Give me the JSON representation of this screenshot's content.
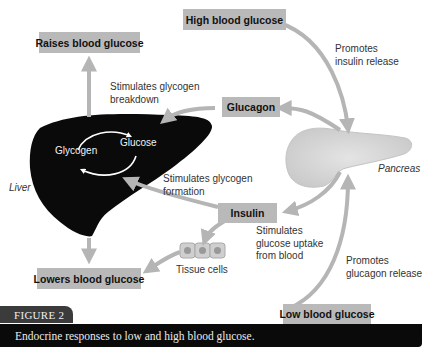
{
  "boxes": {
    "high_blood_glucose": "High blood glucose",
    "raises_blood_glucose": "Raises blood glucose",
    "glucagon": "Glucagon",
    "insulin": "Insulin",
    "lowers_blood_glucose": "Lowers blood glucose",
    "low_blood_glucose": "Low blood glucose"
  },
  "labels": {
    "promotes_insulin_release": [
      "Promotes",
      "insulin release"
    ],
    "stimulates_glycogen_breakdown": [
      "Stimulates glycogen",
      "breakdown"
    ],
    "stimulates_glycogen_formation": [
      "Stimulates glycogen",
      "formation"
    ],
    "stimulates_glucose_uptake": [
      "Stimulates",
      "glucose uptake",
      "from blood"
    ],
    "promotes_glucagon_release": [
      "Promotes",
      "glucagon release"
    ],
    "tissue_cells": "Tissue cells",
    "liver": "Liver",
    "pancreas": "Pancreas",
    "glycogen": "Glycogen",
    "glucose": "Glucose"
  },
  "figure": {
    "tab": "FIGURE 2",
    "caption": "Endocrine responses to low and high blood glucose."
  },
  "colors": {
    "box_fill": "#b9b9b9",
    "arrow": "#b5b5b5",
    "liver": "#0a0a0a",
    "pancreas": "#d9d9d9",
    "caption_bg": "#0a0a0a",
    "tab_bg": "#3b3b3b"
  }
}
